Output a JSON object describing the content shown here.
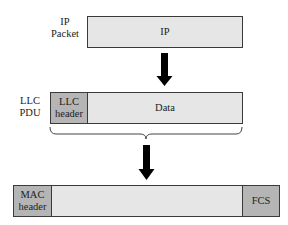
{
  "ip_packet": {
    "label_line1": "IP",
    "label_line2": "Packet",
    "box_text": "IP"
  },
  "llc_pdu": {
    "label_line1": "LLC",
    "label_line2": "PDU",
    "header_line1": "LLC",
    "header_line2": "header",
    "data_text": "Data"
  },
  "mac_frame": {
    "header_line1": "MAC",
    "header_line2": "header",
    "payload_text": "",
    "trailer_text": "FCS"
  },
  "colors": {
    "light_fill": "#e6e6e6",
    "header_fill": "#b5b5b5",
    "border": "#3a3a3a",
    "arrow": "#000000"
  }
}
